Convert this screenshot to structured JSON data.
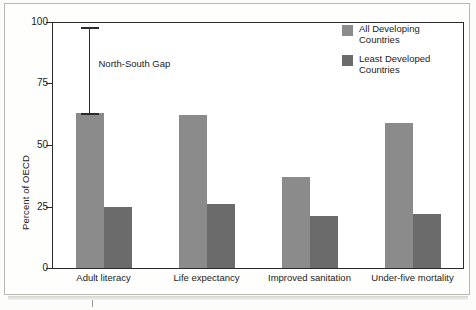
{
  "chart_data": {
    "type": "bar",
    "title": "",
    "xlabel": "",
    "ylabel": "Percent of OECD",
    "ylim": [
      0,
      100
    ],
    "yticks": [
      0,
      25,
      50,
      75,
      100
    ],
    "ytick_labels": [
      "0",
      "25",
      "50",
      "75",
      "100"
    ],
    "grid": false,
    "legend_position": "top-right",
    "categories": [
      "Adult literacy",
      "Life expectancy",
      "Improved sanitation",
      "Under-five mortality"
    ],
    "series": [
      {
        "name": "All Developing Countries",
        "color": "#8b8b8b",
        "values": [
          63,
          62,
          37,
          59
        ]
      },
      {
        "name": "Least Developed Countries",
        "color": "#6b6b6b",
        "values": [
          25,
          26,
          21,
          22
        ]
      }
    ],
    "annotations": [
      {
        "label": "North-South Gap",
        "type": "range-bar",
        "category": "Adult literacy",
        "from": 63,
        "to": 98
      }
    ]
  },
  "legend": {
    "items": [
      {
        "line1": "All Developing",
        "line2": "Countries",
        "swatch": "light"
      },
      {
        "line1": "Least Developed",
        "line2": "Countries",
        "swatch": "dark"
      }
    ]
  },
  "axes": {
    "y_title": "Percent of OECD",
    "y_labels": [
      "100",
      "75",
      "50",
      "25",
      "0"
    ]
  },
  "colors": {
    "all_developing": "#8b8b8b",
    "least_developed": "#6b6b6b",
    "axis": "#2b2b2b",
    "page": "#fefefd"
  }
}
